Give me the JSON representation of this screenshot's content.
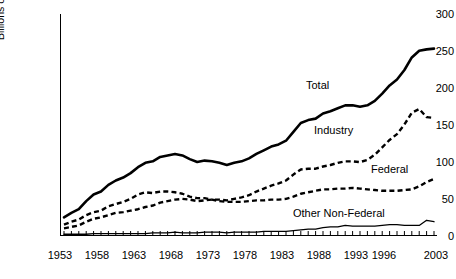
{
  "chart_data": {
    "type": "line",
    "title": "",
    "xlabel": "",
    "ylabel": "Billions of Constant 1996 Dollars",
    "ylim": [
      0,
      300
    ],
    "xlim": [
      1953,
      2003
    ],
    "yticks": [
      0,
      50,
      100,
      150,
      200,
      250,
      300
    ],
    "xticks": [
      1953,
      1958,
      1963,
      1968,
      1973,
      1978,
      1983,
      1988,
      1993,
      1996,
      2003
    ],
    "grid": false,
    "legend_position": "inline-labels",
    "x": [
      1953,
      1954,
      1955,
      1956,
      1957,
      1958,
      1959,
      1960,
      1961,
      1962,
      1963,
      1964,
      1965,
      1966,
      1967,
      1968,
      1969,
      1970,
      1971,
      1972,
      1973,
      1974,
      1975,
      1976,
      1977,
      1978,
      1979,
      1980,
      1981,
      1982,
      1983,
      1984,
      1985,
      1986,
      1987,
      1988,
      1989,
      1990,
      1991,
      1992,
      1993,
      1994,
      1995,
      1996,
      1997,
      1998,
      1999,
      2000,
      2001,
      2002,
      2003
    ],
    "series": [
      {
        "name": "Total",
        "style": "solid",
        "color": "#000000",
        "values": [
          24,
          30,
          35,
          46,
          55,
          59,
          68,
          74,
          78,
          84,
          92,
          98,
          100,
          106,
          108,
          110,
          108,
          103,
          99,
          101,
          100,
          98,
          95,
          98,
          100,
          104,
          110,
          115,
          120,
          123,
          128,
          140,
          152,
          156,
          158,
          165,
          168,
          172,
          176,
          176,
          174,
          176,
          182,
          192,
          203,
          211,
          224,
          241,
          250,
          252,
          253
        ]
      },
      {
        "name": "Industry",
        "style": "dashed",
        "color": "#000000",
        "values": [
          9,
          11,
          13,
          18,
          22,
          24,
          27,
          30,
          31,
          33,
          35,
          38,
          40,
          44,
          46,
          48,
          49,
          48,
          46,
          47,
          48,
          48,
          47,
          49,
          51,
          54,
          59,
          63,
          67,
          70,
          74,
          82,
          89,
          90,
          90,
          93,
          95,
          98,
          100,
          100,
          99,
          102,
          109,
          119,
          129,
          137,
          150,
          166,
          171,
          160,
          159
        ]
      },
      {
        "name": "Federal",
        "style": "dashed",
        "color": "#000000",
        "values": [
          14,
          18,
          21,
          27,
          31,
          33,
          39,
          42,
          45,
          49,
          55,
          58,
          57,
          59,
          59,
          58,
          56,
          52,
          50,
          50,
          48,
          46,
          45,
          45,
          45,
          46,
          47,
          47,
          48,
          48,
          49,
          52,
          56,
          58,
          60,
          62,
          62,
          63,
          63,
          64,
          63,
          62,
          61,
          60,
          60,
          60,
          61,
          62,
          66,
          72,
          76
        ]
      },
      {
        "name": "Other Non-Federal",
        "style": "solid-thin",
        "color": "#000000",
        "values": [
          1,
          1,
          1,
          1,
          2,
          2,
          2,
          2,
          2,
          2,
          2,
          2,
          3,
          3,
          3,
          4,
          3,
          3,
          3,
          4,
          4,
          4,
          3,
          4,
          4,
          4,
          4,
          5,
          5,
          5,
          5,
          6,
          7,
          8,
          8,
          10,
          11,
          11,
          13,
          12,
          12,
          12,
          12,
          13,
          14,
          14,
          13,
          13,
          13,
          20,
          18
        ]
      }
    ],
    "annotations": [
      {
        "label": "Total",
        "x": 1989,
        "y": 196
      },
      {
        "label": "Industry",
        "x": 1990,
        "y": 135
      },
      {
        "label": "Federal",
        "x": 1998,
        "y": 93
      },
      {
        "label": "Other Non-Federal",
        "x": 1989,
        "y": 34
      }
    ]
  },
  "axis": {
    "y_title": "Billions of Constant 1996 Dollars",
    "y_labels": [
      "300",
      "250",
      "200",
      "150",
      "100",
      "50",
      "0"
    ],
    "x_labels": [
      "1953",
      "1958",
      "1963",
      "1968",
      "1973",
      "1978",
      "1983",
      "1988",
      "1993",
      "1996",
      "2003"
    ]
  },
  "labels": {
    "total": "Total",
    "industry": "Industry",
    "federal": "Federal",
    "other_non_federal": "Other Non-Federal"
  }
}
